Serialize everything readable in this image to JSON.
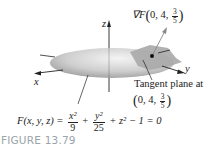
{
  "figure": {
    "axis_labels": {
      "x": "x",
      "y": "y",
      "z": "z"
    },
    "gradient_label": {
      "prefix": "∇F",
      "open": "(",
      "coords": "0, 4, ",
      "frac_num": "3",
      "frac_den": "5",
      "close": ")"
    },
    "tangent_label": {
      "line1": "Tangent plane at",
      "open": "(",
      "coords": "0, 4, ",
      "frac_num": "3",
      "frac_den": "5",
      "close": ")"
    },
    "equation": {
      "lhs": "F(x, y, z) = ",
      "term1_num": "x²",
      "term1_den": "9",
      "plus1": " + ",
      "term2_num": "y²",
      "term2_den": "25",
      "rest": " + z² − 1 = 0"
    },
    "caption": "FIGURE 13.79",
    "colors": {
      "caption": "#9aa4aa",
      "ellipsoid": "#c8c8c8",
      "plane": "#a9a9a9",
      "ink": "#222222"
    }
  }
}
